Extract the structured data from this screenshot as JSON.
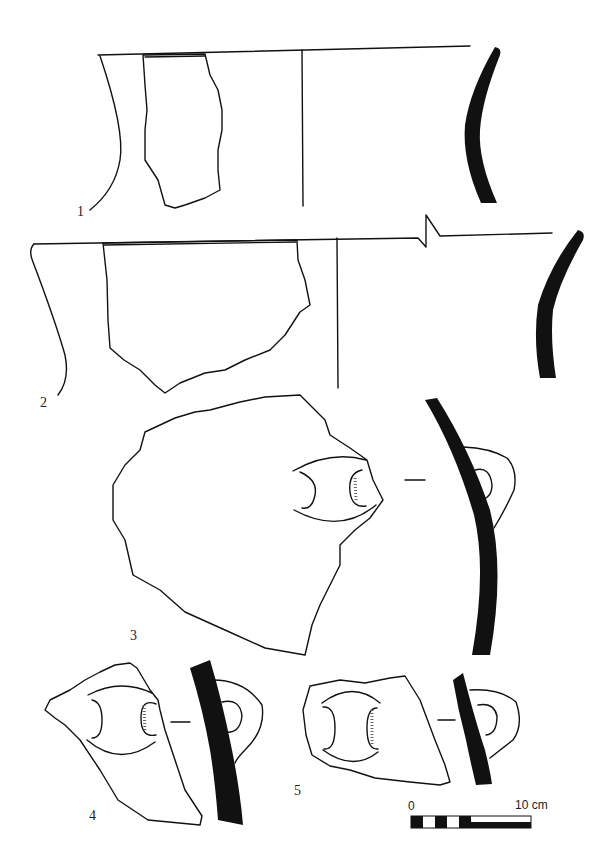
{
  "figure": {
    "type": "archaeological pottery drawing plate",
    "background": "#ffffff",
    "ink": "#111111",
    "items": [
      {
        "number": "1",
        "label": "1",
        "description": "rim sherd, flared neck, profile and section"
      },
      {
        "number": "2",
        "label": "2",
        "description": "rim sherd with broken-line rim diameter, profile and section"
      },
      {
        "number": "3",
        "label": "3",
        "description": "body sherd with lug handle, section"
      },
      {
        "number": "4",
        "label": "4",
        "description": "body sherd with lug handle, section"
      },
      {
        "number": "5",
        "label": "5",
        "description": "body sherd with lug handle, section"
      }
    ],
    "scale_bar": {
      "start_label": "0",
      "end_label": "10 cm",
      "segments": [
        "black",
        "white",
        "black",
        "white",
        "black",
        "split"
      ]
    }
  }
}
